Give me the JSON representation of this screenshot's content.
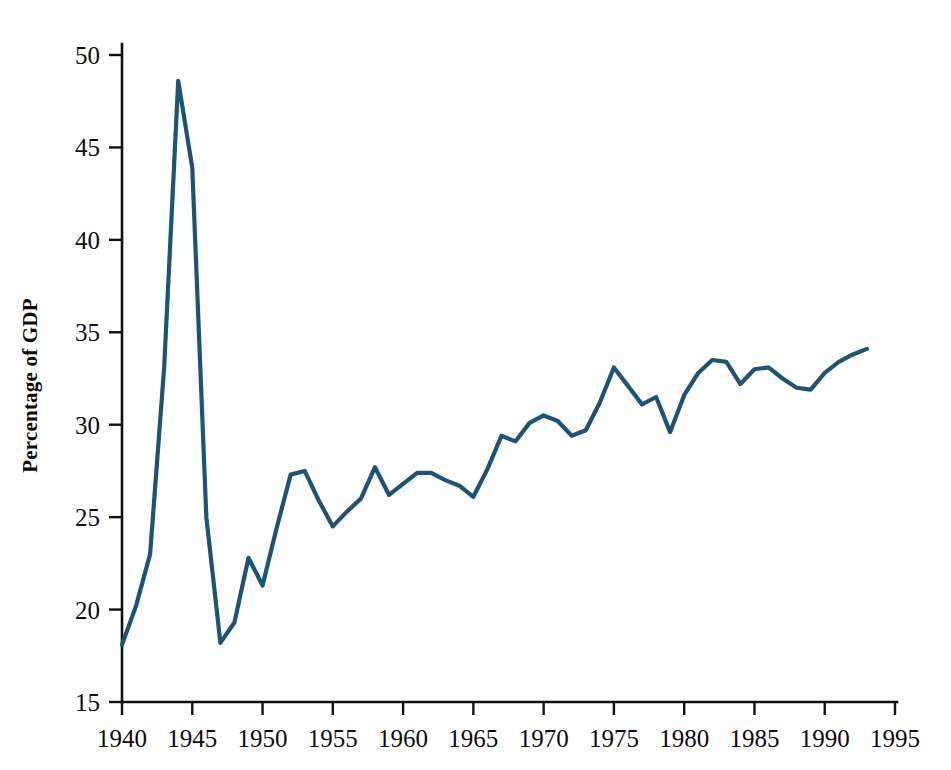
{
  "figure": {
    "background_color": "#ffffff",
    "axis_color": "#111111",
    "ylabel": "Percentage of GDP"
  },
  "chart_data": {
    "type": "line",
    "title": "",
    "subtitle": "",
    "xlabel": "",
    "ylabel": "Percentage of GDP",
    "xlim": [
      1940,
      1995
    ],
    "ylim": [
      15,
      50
    ],
    "grid": false,
    "legend": null,
    "line_color": "#1d5375",
    "x_ticks": [
      1940,
      1945,
      1950,
      1955,
      1960,
      1965,
      1970,
      1975,
      1980,
      1985,
      1990,
      1995
    ],
    "x_tick_labels": [
      "1940",
      "1945",
      "1950",
      "1955",
      "1960",
      "1965",
      "1970",
      "1975",
      "1980",
      "1985",
      "1990",
      "1995"
    ],
    "y_ticks": [
      15,
      20,
      25,
      30,
      35,
      40,
      45,
      50
    ],
    "y_tick_labels": [
      "15",
      "20",
      "25",
      "30",
      "35",
      "40",
      "45",
      "50"
    ],
    "series": [
      {
        "name": "Percentage of GDP",
        "color": "#1d5375",
        "x": [
          1940,
          1941,
          1942,
          1943,
          1944,
          1945,
          1946,
          1947,
          1948,
          1949,
          1950,
          1951,
          1952,
          1953,
          1954,
          1955,
          1956,
          1957,
          1958,
          1959,
          1960,
          1961,
          1962,
          1963,
          1964,
          1965,
          1966,
          1967,
          1968,
          1969,
          1970,
          1971,
          1972,
          1973,
          1974,
          1975,
          1976,
          1977,
          1978,
          1979,
          1980,
          1981,
          1982,
          1983,
          1984,
          1985,
          1986,
          1987,
          1988,
          1989,
          1990,
          1991,
          1992,
          1993
        ],
        "values": [
          18.1,
          20.2,
          23.0,
          33.1,
          48.6,
          43.9,
          25.0,
          18.2,
          19.3,
          22.8,
          21.3,
          24.4,
          27.3,
          27.5,
          25.9,
          24.5,
          25.3,
          26.0,
          27.7,
          26.2,
          26.8,
          27.4,
          27.4,
          27.0,
          26.7,
          26.1,
          27.6,
          29.4,
          29.1,
          30.1,
          30.5,
          30.2,
          29.4,
          29.7,
          31.2,
          33.1,
          32.1,
          31.1,
          31.5,
          29.6,
          31.6,
          32.8,
          33.5,
          33.4,
          32.2,
          33.0,
          33.1,
          32.5,
          32.0,
          31.9,
          32.8,
          33.4,
          33.8,
          34.1
        ]
      }
    ]
  }
}
